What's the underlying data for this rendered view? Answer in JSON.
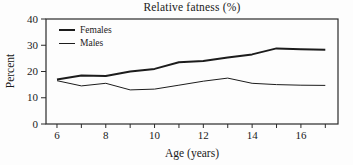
{
  "chart_data": {
    "type": "line",
    "title": "Relative fatness (%)",
    "xlabel": "Age (years)",
    "ylabel": "Percent",
    "x": [
      6,
      7,
      8,
      9,
      10,
      11,
      12,
      13,
      14,
      15,
      16,
      17
    ],
    "series": [
      {
        "name": "Females",
        "values": [
          17,
          18.5,
          18.3,
          20,
          21,
          23.5,
          24,
          25.3,
          26.5,
          28.8,
          28.5,
          28.3
        ],
        "stroke_width": 2
      },
      {
        "name": "Males",
        "values": [
          16.5,
          14.5,
          15.5,
          13,
          13.3,
          14.8,
          16.3,
          17.5,
          15.5,
          15,
          14.8,
          14.7
        ],
        "stroke_width": 1
      }
    ],
    "ylim": [
      0,
      40
    ],
    "xlim": [
      5.55,
      17.52
    ],
    "yticks": [
      0,
      10,
      20,
      30,
      40
    ],
    "xticks_minor": [
      6,
      7,
      8,
      9,
      10,
      11,
      12,
      13,
      14,
      15,
      16,
      17
    ],
    "xticks_labeled": [
      6,
      8,
      10,
      12,
      14,
      16
    ],
    "legend_position": "top-left",
    "grid": false,
    "colors": {
      "line": "#1c1c1c",
      "axis": "#2b2b2b",
      "background": "#fdfdfd"
    }
  }
}
